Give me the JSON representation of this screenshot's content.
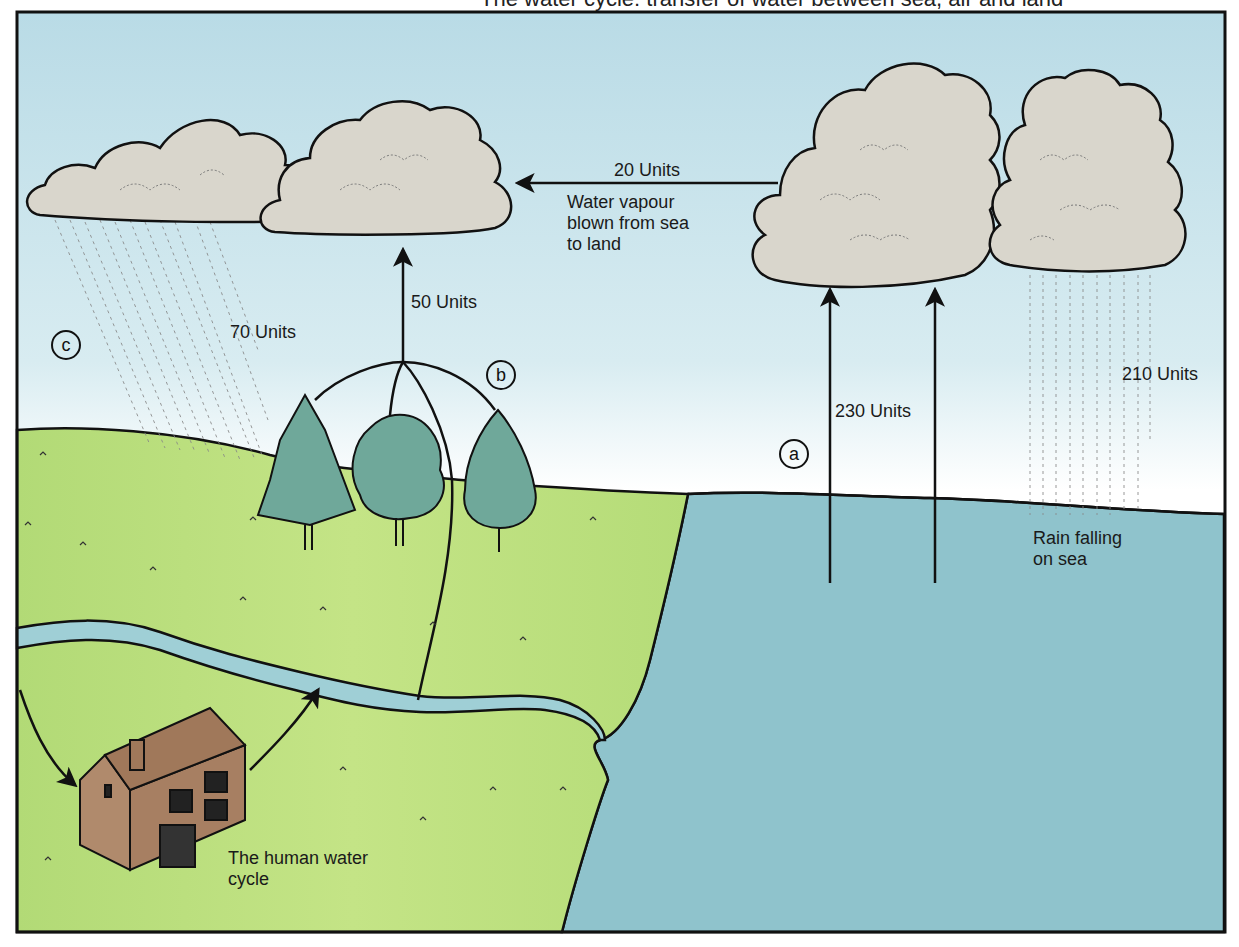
{
  "title": {
    "text": "The water cycle: transfer of water between sea, air and land",
    "note": "partially cropped at top edge"
  },
  "colors": {
    "sky_top": "#bcdde8",
    "sky_bottom": "#ffffff",
    "land": "#b5dc78",
    "land_light": "#c6e58a",
    "sea": "#8fc3cc",
    "river": "#9fcfd6",
    "cloud": "#d9d6cc",
    "tree": "#6fa89a",
    "house": "#b08a6c",
    "outline": "#111111"
  },
  "flows": [
    {
      "id": "sea-to-land-vapour",
      "value": "20 Units",
      "description": "Water vapour\nblown from sea\nto land"
    },
    {
      "id": "transpiration",
      "value": "50 Units",
      "marker": "b"
    },
    {
      "id": "rain-on-land",
      "value": "70 Units",
      "marker": "c"
    },
    {
      "id": "evaporation-from-sea",
      "value": "230 Units",
      "marker": "a"
    },
    {
      "id": "rain-on-sea",
      "value": "210 Units",
      "description": "Rain falling\non sea"
    }
  ],
  "labels": {
    "units_20": "20 Units",
    "vapour_desc": "Water vapour\nblown from sea\nto land",
    "units_50": "50 Units",
    "units_70": "70 Units",
    "units_230": "230 Units",
    "units_210": "210 Units",
    "rain_sea": "Rain falling\non sea",
    "human_cycle": "The human water\ncycle"
  },
  "markers": {
    "a": "a",
    "b": "b",
    "c": "c"
  },
  "elements": {
    "clouds": [
      "land-cloud-left",
      "land-cloud-right",
      "sea-cloud-left",
      "sea-cloud-right"
    ],
    "trees": [
      "conifer",
      "broadleaf",
      "poplar"
    ],
    "house": "house"
  }
}
